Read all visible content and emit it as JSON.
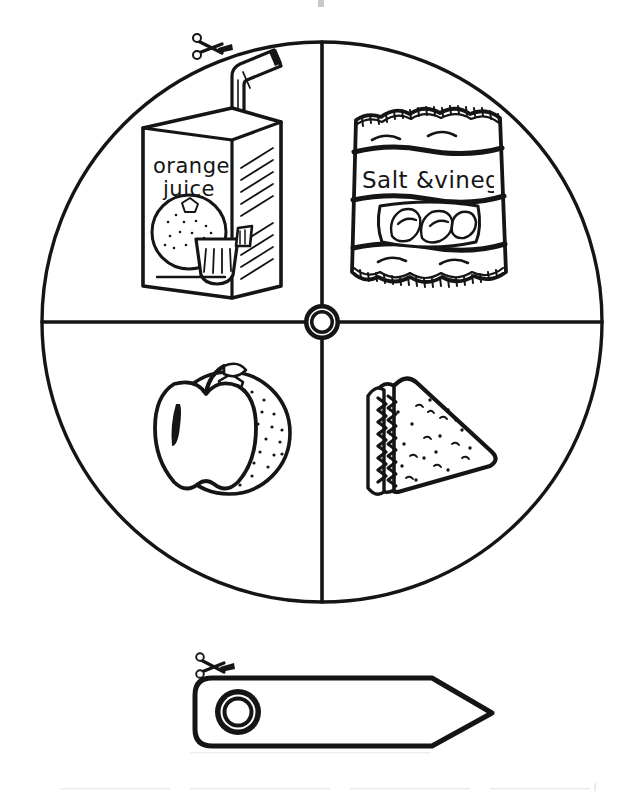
{
  "page": {
    "background_color": "#ffffff",
    "ink_color": "#151515",
    "width": 641,
    "height": 795
  },
  "spinner": {
    "name": "four-segment-food-spinner",
    "center_x": 322,
    "center_y": 322,
    "radius": 280,
    "segment_count": 4,
    "hub": {
      "name": "center-pivot-hub",
      "outer_radius": 17,
      "inner_radius": 9
    },
    "cut_guide": {
      "icon": "scissors-icon",
      "label": "cut along line",
      "x": 205,
      "y": 45
    },
    "segments": [
      {
        "position": "top-left",
        "item": "orange-juice-carton",
        "label": "Orange Juice",
        "carton_text_line1": "orange",
        "carton_text_line2": "juice",
        "has_straw": true
      },
      {
        "position": "top-right",
        "item": "crisps-packet",
        "label": "Salt & Vinegar Crisps",
        "packet_text": "Salt &vinega",
        "packet_text_full": "Salt & vinegar"
      },
      {
        "position": "bottom-left",
        "item": "apple-and-orange",
        "label": "Apple and Orange",
        "fruits": [
          "apple",
          "orange"
        ]
      },
      {
        "position": "bottom-right",
        "item": "sandwich",
        "label": "Sandwich",
        "shape": "triangle"
      }
    ]
  },
  "pointer": {
    "name": "spinner-arrow-pointer",
    "label": "Arrow pointer",
    "x": 195,
    "y": 678,
    "tip_x": 492,
    "tip_y": 713,
    "height": 67,
    "hole": {
      "name": "pivot-hole",
      "cx": 238,
      "cy": 712,
      "outer_radius": 22,
      "inner_radius": 12
    },
    "cut_guide": {
      "icon": "scissors-icon",
      "label": "cut along line",
      "x": 206,
      "y": 663
    }
  },
  "artifacts": {
    "top_mark": {
      "x": 319,
      "y": 0,
      "width": 5,
      "height": 6
    },
    "bottom_smudge_note": "faint scanner speckle along lower edge"
  }
}
